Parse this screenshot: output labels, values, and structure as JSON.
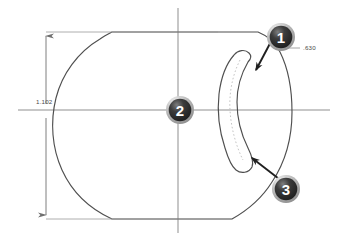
{
  "drawing": {
    "title": "Cam plate outline with curved slot",
    "background_color": "#ffffff",
    "line_color": "#4f4f4f",
    "centerline_color": "#8a8a8a",
    "dimension_color": "#7d7d7d",
    "balloon_fill": "#2e2e2e",
    "balloon_ring": "#b8b8b8",
    "balloon_text_color": "#ffffff"
  },
  "dimensions": [
    {
      "id": "overall-height",
      "value": "1.102",
      "orientation": "vertical",
      "position": "left"
    },
    {
      "id": "slot-width",
      "value": ".630",
      "orientation": "leader",
      "position": "upper-right"
    }
  ],
  "balloons": [
    {
      "id": "balloon-1",
      "label": "1",
      "points_to": "slot-upper-end"
    },
    {
      "id": "balloon-2",
      "label": "2",
      "points_to": "center-datum"
    },
    {
      "id": "balloon-3",
      "label": "3",
      "points_to": "slot-lower-end"
    }
  ],
  "features": {
    "outline_name": "part-outline",
    "slot_name": "curved-slot",
    "slot_centerline_name": "slot-centerline",
    "horizontal_centerline_name": "horizontal-centerline",
    "vertical_centerline_name": "vertical-centerline"
  }
}
